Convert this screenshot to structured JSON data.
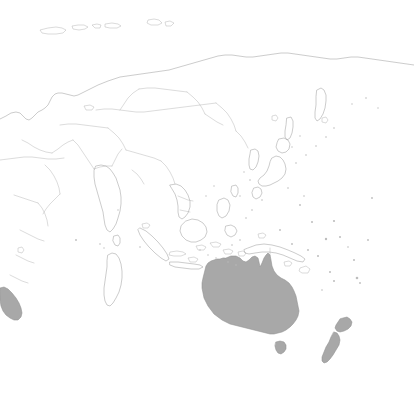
{
  "map": {
    "title": "World map centered on Asia-Pacific",
    "projection_note": "equirectangular",
    "width": 414,
    "height": 403,
    "background_color": "#ffffff",
    "outline_color": "#a2a2a2",
    "border_color": "#b0b0b0",
    "highlight_fill_color": "#a8a8a8",
    "highlight_stroke_color": "#8f8f8f",
    "legend_visible": false,
    "labels_visible": false,
    "graticule_visible": false,
    "highlighted_regions": [
      "Australia",
      "Tasmania",
      "New Zealand North Island",
      "New Zealand South Island",
      "Southern Africa (partial, left edge)"
    ],
    "unhighlighted_regions": [
      "Russia",
      "China",
      "Mongolia",
      "Kazakhstan",
      "India",
      "Pakistan",
      "Iran",
      "Saudi Arabia",
      "Japan",
      "Korea",
      "Philippines",
      "Indonesia",
      "Papua New Guinea",
      "Madagascar",
      "Somalia",
      "Ethiopia",
      "Sri Lanka",
      "Thailand",
      "Vietnam",
      "Myanmar",
      "Malaysia",
      "Svalbard",
      "Novaya Zemlya",
      "Severnaya Zemlya",
      "Sakhalin",
      "Kamchatka",
      "Taiwan",
      "Pacific island groups"
    ]
  },
  "geometry": {
    "eurasia_outline": "M 0,119 L 6,116 L 11,113 L 16,112 L 20,113 L 23,116 L 26,119 L 29,120 L 32,118 L 35,115 L 38,112 L 42,110 L 45,108 L 48,105 L 50,101 L 52,97 L 55,94 L 58,93 L 62,93 L 66,94 L 70,95 L 74,96 L 78,95 L 82,93 L 86,91 L 90,89 L 94,87 L 98,85 L 103,83 L 108,81 L 114,79 L 120,77 L 127,76 L 134,75 L 141,74 L 148,73 L 155,72 L 162,71 L 169,70 L 176,68 L 183,66 L 190,64 L 197,62 L 204,60 L 211,58 L 218,56 L 225,55 L 232,55 L 239,56 L 246,57 L 253,57 L 260,56 L 267,55 L 274,54 L 281,53 L 288,53 L 295,54 L 302,55 L 309,56 L 316,57 L 323,58 L 330,59 L 337,59 L 344,58 L 351,57 L 358,57 L 365,58 L 372,59 L 379,60 L 386,61 L 393,62 L 400,63 L 407,64 L 414,65",
    "arctic_islands": [
      "M 40,30 L 48,28 L 56,27 L 62,28 L 66,30 L 63,33 L 56,34 L 48,34 L 42,33 Z",
      "M 72,26 L 78,25 L 84,25 L 88,27 L 85,29 L 79,30 L 73,29 Z",
      "M 92,25 L 97,24 L 101,25 L 100,28 L 95,28 Z",
      "M 105,24 L 112,23 L 118,24 L 121,26 L 117,28 L 110,28 L 105,27 Z",
      "M 148,20 L 154,19 L 159,20 L 162,23 L 158,25 L 151,25 L 147,23 Z",
      "M 165,22 L 170,21 L 174,23 L 171,26 L 166,26 Z"
    ],
    "australia_mainland": "M 226,258 L 231,256 L 236,256 L 240,258 L 243,261 L 246,262 L 249,260 L 252,257 L 255,256 L 258,258 L 259,262 L 260,267 L 262,263 L 264,258 L 266,255 L 268,253 L 270,255 L 271,260 L 272,266 L 274,271 L 277,275 L 281,278 L 285,280 L 289,283 L 292,287 L 294,291 L 296,296 L 297,301 L 298,306 L 299,311 L 298,316 L 296,320 L 293,324 L 290,327 L 286,330 L 282,332 L 278,333 L 274,334 L 270,334 L 266,333 L 262,332 L 258,331 L 254,330 L 250,329 L 246,328 L 242,327 L 238,326 L 234,325 L 230,324 L 226,322 L 222,320 L 218,317 L 214,314 L 211,310 L 208,306 L 206,302 L 204,298 L 203,293 L 202,288 L 202,283 L 203,278 L 204,274 L 205,270 L 206,266 L 208,263 L 211,261 L 214,260 L 217,259 L 220,259 L 223,258 Z",
    "tasmania": "M 276,342 L 280,341 L 284,342 L 286,345 L 286,349 L 284,352 L 281,354 L 278,353 L 276,350 L 275,346 Z",
    "nz_north_island": "M 343,318 L 347,317 L 350,319 L 352,322 L 351,326 L 348,329 L 344,331 L 340,332 L 337,331 L 335,328 L 336,325 L 338,322 L 340,319 Z",
    "nz_south_island": "M 334,332 L 337,333 L 339,336 L 340,340 L 339,345 L 336,350 L 333,355 L 330,359 L 327,362 L 324,363 L 322,361 L 322,357 L 324,352 L 326,347 L 329,342 L 331,337 Z",
    "southern_africa_partial": "M 0,288 L 4,287 L 8,289 L 12,293 L 16,298 L 19,303 L 21,308 L 22,313 L 21,317 L 18,320 L 14,320 L 10,318 L 6,315 L 3,311 L 1,306 L 0,300 Z",
    "madagascar": "M 108,255 L 112,253 L 116,254 L 119,258 L 121,264 L 122,271 L 122,278 L 121,285 L 119,292 L 116,298 L 113,303 L 110,306 L 107,305 L 105,301 L 104,295 L 104,288 L 105,281 L 106,274 L 107,267 L 107,261 Z",
    "japan_honshu": "M 272,158 L 276,156 L 280,157 L 283,160 L 285,164 L 286,169 L 285,174 L 282,178 L 278,181 L 274,183 L 270,185 L 266,186 L 262,186 L 259,184 L 258,181 L 260,178 L 264,175 L 267,171 L 269,166 L 270,162 Z",
    "japan_hokkaido": "M 279,139 L 284,138 L 288,140 L 290,144 L 289,149 L 286,152 L 282,153 L 278,151 L 276,147 L 277,143 Z",
    "japan_kyushu": "M 254,188 L 258,187 L 261,189 L 262,193 L 260,197 L 256,199 L 253,197 L 252,193 Z",
    "korea": "M 251,150 L 255,149 L 258,151 L 259,156 L 258,162 L 256,167 L 253,170 L 250,169 L 249,165 L 249,159 L 250,154 Z",
    "sakhalin": "M 287,118 L 291,117 L 293,121 L 293,127 L 292,133 L 290,138 L 287,140 L 285,137 L 285,131 L 286,125 Z",
    "india": "M 96,166 L 101,165 L 106,166 L 110,169 L 113,173 L 116,178 L 118,184 L 120,190 L 121,197 L 121,204 L 120,211 L 118,218 L 116,224 L 113,229 L 110,232 L 107,230 L 105,225 L 104,219 L 103,212 L 101,205 L 99,198 L 97,191 L 95,184 L 94,177 L 94,171 Z",
    "sri_lanka": "M 114,236 L 118,235 L 120,238 L 120,243 L 118,246 L 115,245 L 113,241 Z",
    "borneo": "M 186,221 L 192,219 L 198,220 L 203,223 L 206,227 L 207,232 L 205,237 L 201,240 L 196,242 L 191,242 L 186,240 L 182,236 L 180,231 L 181,226 Z",
    "sumatra": "M 140,228 L 146,231 L 152,236 L 158,242 L 163,248 L 167,254 L 169,259 L 166,261 L 161,258 L 155,253 L 149,247 L 144,241 L 140,235 L 138,230 Z",
    "java": "M 170,262 L 178,262 L 186,263 L 194,264 L 200,265 L 203,267 L 199,269 L 191,269 L 183,268 L 175,267 L 170,265 Z",
    "new_guinea": "M 248,248 L 256,245 L 264,244 L 272,245 L 280,247 L 288,250 L 295,253 L 301,256 L 305,259 L 303,262 L 297,261 L 290,258 L 283,255 L 276,253 L 269,252 L 262,252 L 255,253 L 249,254 L 245,253 L 244,250 Z",
    "philippines_luzon": "M 219,200 L 224,198 L 228,200 L 230,205 L 229,211 L 226,216 L 222,218 L 219,216 L 217,211 L 217,205 Z",
    "philippines_mindanao": "M 226,226 L 231,225 L 235,227 L 237,231 L 235,235 L 231,237 L 227,235 L 225,231 Z",
    "taiwan": "M 232,186 L 236,185 L 238,188 L 238,193 L 236,197 L 233,196 L 231,192 Z",
    "kamchatka": "M 317,90 L 321,88 L 324,90 L 326,95 L 326,101 L 325,108 L 323,114 L 320,119 L 317,121 L 315,118 L 315,112 L 316,105 L 316,97 Z",
    "indochina": "M 170,185 L 176,184 L 181,186 L 185,190 L 188,195 L 190,201 L 190,207 L 188,213 L 185,217 L 182,219 L 179,217 L 178,212 L 178,206 L 177,200 L 175,194 L 172,189 Z",
    "internal_borders": [
      "M 0,160 L 8,159 L 16,158 L 24,157 L 32,157 L 40,158 L 48,159 L 56,159 L 64,158",
      "M 22,140 L 28,143 L 34,147 L 40,150 L 46,152 L 52,153",
      "M 52,153 L 58,149 L 63,145 L 68,142 L 73,140",
      "M 73,140 L 78,145 L 82,151 L 86,157 L 90,163 L 94,169",
      "M 94,169 L 100,167 L 106,166 L 112,166",
      "M 60,125 L 68,124 L 76,124 L 84,125 L 92,126 L 100,127 L 108,128",
      "M 108,128 L 114,133 L 119,138 L 123,144 L 126,150",
      "M 126,150 L 133,152 L 140,154 L 147,156 L 154,158 L 161,161",
      "M 161,161 L 166,166 L 170,172 L 173,178 L 175,184",
      "M 96,110 L 104,109 L 112,109 L 120,110 L 128,111 L 136,112 L 144,112 L 152,111 L 160,110 L 168,109 L 176,108 L 184,107 L 192,106 L 200,105 L 208,104 L 216,103",
      "M 216,103 L 222,108 L 227,113 L 231,119 L 234,125 L 236,131",
      "M 236,131 L 241,136 L 245,142 L 248,148",
      "M 120,110 L 124,104 L 128,98 L 133,93 L 139,89",
      "M 139,89 L 147,88 L 155,88 L 163,89 L 171,90 L 179,91 L 187,92",
      "M 187,92 L 193,97 L 198,102 L 202,108 L 205,114",
      "M 205,114 L 211,118 L 217,122 L 223,125",
      "M 45,165 L 50,170 L 54,176 L 57,182 L 59,188 L 60,194",
      "M 60,194 L 55,199 L 50,204 L 46,209 L 43,214",
      "M 14,195 L 20,197 L 26,199 L 32,201 L 38,203",
      "M 38,203 L 42,208 L 45,214 L 47,220 L 48,226",
      "M 20,230 L 26,233 L 32,236 L 38,239 L 44,241",
      "M 16,255 L 22,258 L 28,261 L 34,263",
      "M 10,275 L 16,278 L 22,281 L 28,283",
      "M 178,196 L 183,198 L 188,200 L 193,201",
      "M 180,210 L 185,211 L 190,212",
      "M 270,248 L 270,256",
      "M 132,170 L 137,174 L 141,179 L 144,184",
      "M 112,166 L 115,160 L 118,154 L 122,149"
    ],
    "pacific_specks": [
      {
        "cx": 312,
        "cy": 222,
        "r": 1.0
      },
      {
        "cx": 334,
        "cy": 221,
        "r": 1.1
      },
      {
        "cx": 326,
        "cy": 239,
        "r": 1.2
      },
      {
        "cx": 340,
        "cy": 237,
        "r": 1.0
      },
      {
        "cx": 354,
        "cy": 260,
        "r": 1.0
      },
      {
        "cx": 330,
        "cy": 272,
        "r": 1.0
      },
      {
        "cx": 334,
        "cy": 281,
        "r": 1.0
      },
      {
        "cx": 357,
        "cy": 278,
        "r": 1.3
      },
      {
        "cx": 360,
        "cy": 283,
        "r": 0.9
      },
      {
        "cx": 368,
        "cy": 240,
        "r": 0.9
      },
      {
        "cx": 372,
        "cy": 198,
        "r": 0.9
      },
      {
        "cx": 300,
        "cy": 205,
        "r": 0.9
      },
      {
        "cx": 252,
        "cy": 210,
        "r": 0.8
      },
      {
        "cx": 246,
        "cy": 218,
        "r": 0.8
      },
      {
        "cx": 280,
        "cy": 230,
        "r": 0.9
      },
      {
        "cx": 292,
        "cy": 244,
        "r": 0.9
      },
      {
        "cx": 308,
        "cy": 250,
        "r": 0.9
      },
      {
        "cx": 318,
        "cy": 256,
        "r": 1.0
      },
      {
        "cx": 240,
        "cy": 240,
        "r": 0.8
      },
      {
        "cx": 232,
        "cy": 245,
        "r": 0.8
      },
      {
        "cx": 304,
        "cy": 196,
        "r": 0.8
      },
      {
        "cx": 288,
        "cy": 188,
        "r": 0.8
      },
      {
        "cx": 262,
        "cy": 200,
        "r": 0.8
      },
      {
        "cx": 250,
        "cy": 180,
        "r": 0.8
      },
      {
        "cx": 244,
        "cy": 172,
        "r": 0.7
      },
      {
        "cx": 240,
        "cy": 196,
        "r": 0.7
      },
      {
        "cx": 348,
        "cy": 247,
        "r": 0.8
      },
      {
        "cx": 322,
        "cy": 290,
        "r": 0.8
      },
      {
        "cx": 140,
        "cy": 247,
        "r": 0.8
      },
      {
        "cx": 100,
        "cy": 244,
        "r": 0.8
      },
      {
        "cx": 104,
        "cy": 248,
        "r": 0.7
      },
      {
        "cx": 76,
        "cy": 240,
        "r": 0.9
      },
      {
        "cx": 118,
        "cy": 210,
        "r": 0.7
      },
      {
        "cx": 206,
        "cy": 196,
        "r": 0.7
      },
      {
        "cx": 214,
        "cy": 186,
        "r": 0.7
      },
      {
        "cx": 296,
        "cy": 163,
        "r": 0.8
      },
      {
        "cx": 306,
        "cy": 155,
        "r": 0.8
      },
      {
        "cx": 316,
        "cy": 146,
        "r": 0.8
      },
      {
        "cx": 326,
        "cy": 137,
        "r": 0.8
      },
      {
        "cx": 334,
        "cy": 128,
        "r": 0.8
      },
      {
        "cx": 300,
        "cy": 136,
        "r": 0.7
      },
      {
        "cx": 292,
        "cy": 147,
        "r": 0.7
      },
      {
        "cx": 366,
        "cy": 98,
        "r": 0.8
      },
      {
        "cx": 352,
        "cy": 104,
        "r": 0.7
      },
      {
        "cx": 378,
        "cy": 108,
        "r": 0.7
      },
      {
        "cx": 200,
        "cy": 250,
        "r": 0.7
      },
      {
        "cx": 208,
        "cy": 255,
        "r": 0.7
      },
      {
        "cx": 216,
        "cy": 258,
        "r": 0.7
      },
      {
        "cx": 228,
        "cy": 262,
        "r": 0.7
      },
      {
        "cx": 236,
        "cy": 265,
        "r": 0.7
      }
    ],
    "small_islands": [
      "M 238,252 L 243,251 L 246,253 L 244,256 L 239,256 Z",
      "M 300,268 L 306,266 L 310,269 L 308,273 L 302,273 L 299,271 Z",
      "M 284,262 L 289,261 L 292,263 L 290,266 L 285,266 Z",
      "M 258,234 L 263,233 L 266,235 L 264,238 L 259,238 Z",
      "M 210,243 L 216,242 L 221,244 L 219,247 L 213,247 Z",
      "M 223,250 L 229,249 L 233,251 L 231,254 L 225,254 Z",
      "M 196,246 L 202,245 L 206,247 L 204,250 L 198,250 Z",
      "M 170,252 L 177,251 L 183,252 L 186,254 L 181,256 L 174,256 L 169,255 Z",
      "M 188,258 L 194,257 L 198,259 L 196,262 L 190,262 Z",
      "M 142,224 L 147,223 L 150,225 L 148,228 L 143,228 Z",
      "M 272,116 L 276,115 L 278,118 L 276,121 L 272,120 Z",
      "M 84,106 L 90,105 L 94,107 L 92,110 L 86,110 Z",
      "M 18,248 L 22,247 L 24,250 L 22,253 L 18,252 Z",
      "M 322,118 L 326,117 L 328,120 L 326,123 L 322,122 Z"
    ]
  }
}
